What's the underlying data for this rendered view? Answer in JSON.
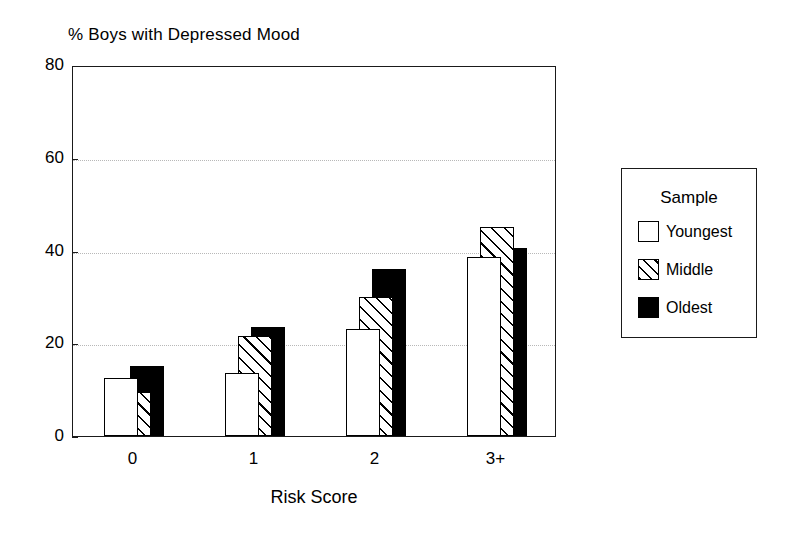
{
  "chart_data": {
    "type": "bar",
    "title": "% Boys with Depressed Mood",
    "xlabel": "Risk Score",
    "ylabel": "",
    "categories": [
      "0",
      "1",
      "2",
      "3+"
    ],
    "ylim": [
      0,
      80
    ],
    "yticks": [
      0,
      20,
      40,
      60,
      80
    ],
    "ytick_labels": [
      "0",
      "20",
      "40",
      "60",
      "80"
    ],
    "grid": "horizontal-dotted",
    "legend_position": "right-outside",
    "legend_title": "Sample",
    "series": [
      {
        "name": "Youngest",
        "fill": "white",
        "values": [
          12.5,
          13.5,
          23,
          38.5
        ]
      },
      {
        "name": "Middle",
        "fill": "hatched",
        "values": [
          9.5,
          21.5,
          30,
          45
        ]
      },
      {
        "name": "Oldest",
        "fill": "black",
        "values": [
          15,
          23.5,
          36,
          40.5
        ]
      }
    ]
  },
  "legend": {
    "title": "Sample",
    "entries": [
      {
        "label": "Youngest",
        "swatch": "white-square"
      },
      {
        "label": "Middle",
        "swatch": "hatched-square"
      },
      {
        "label": "Oldest",
        "swatch": "black-square"
      }
    ]
  },
  "colors": {
    "axis": "#1a1a1a",
    "gridline": "#b8b8b8",
    "bar_outline": "#000000",
    "youngest_fill": "#ffffff",
    "middle_fill": "#ffffff",
    "oldest_fill": "#000000",
    "background": "#ffffff"
  }
}
